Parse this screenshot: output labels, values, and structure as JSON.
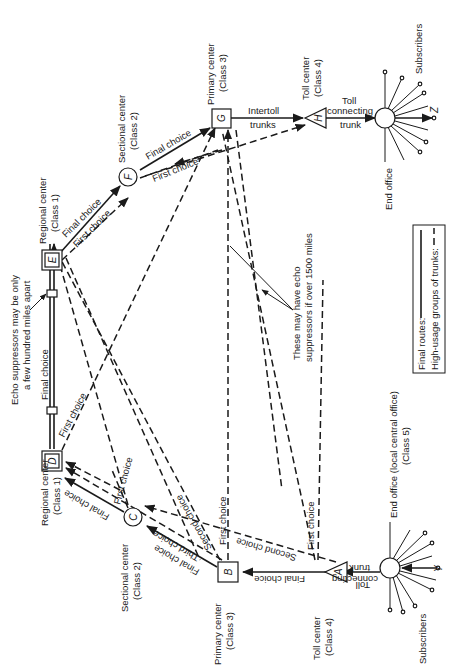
{
  "diagram": {
    "nodes": {
      "A": {
        "letter": "A",
        "type": "Toll center",
        "class": "(Class 4)"
      },
      "B": {
        "letter": "B",
        "type": "Primary center",
        "class": "(Class 3)"
      },
      "C": {
        "letter": "C",
        "type": "Sectional center",
        "class": "(Class 2)"
      },
      "D": {
        "letter": "D",
        "type": "Regional center",
        "class": "(Class 1)"
      },
      "E": {
        "letter": "E",
        "type": "Regional center",
        "class": "(Class 1)"
      },
      "F": {
        "letter": "F",
        "type": "Sectional center",
        "class": "(Class 2)"
      },
      "G": {
        "letter": "G",
        "type": "Primary center",
        "class": "(Class 3)"
      },
      "H": {
        "letter": "H",
        "type": "Toll center",
        "class": "(Class 4)"
      },
      "Y": {
        "letter": "Y"
      },
      "Z": {
        "letter": "Z"
      }
    },
    "end_office_left": {
      "line1": "End office (local central office)",
      "line2": "(Class 5)"
    },
    "end_office_right": {
      "label": "End office"
    },
    "subscribers_left": "Subscribers",
    "subscribers_right": "Subscribers",
    "trunk_labels": {
      "toll_connecting_left": [
        "Toll",
        "connecting",
        "trunk"
      ],
      "toll_connecting_right": [
        "Toll",
        "connecting",
        "trunk"
      ],
      "intertoll": [
        "Intertoll",
        "trunks"
      ],
      "final_choice": "Final choice",
      "first_choice": "First choice",
      "second_choice": "Second choice",
      "third_choice": "Third choice"
    },
    "annotations": {
      "echo_short": [
        "Echo suppressors may be only",
        "a few hundred miles apart"
      ],
      "echo_long": [
        "These may have echo",
        "suppressors if over 1500 miles"
      ]
    },
    "legend": {
      "final_routes": "Final routes:",
      "high_usage": "High-usage groups of trunks:"
    }
  }
}
